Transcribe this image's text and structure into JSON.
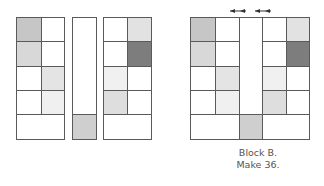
{
  "colors": {
    "white": "#ffffff",
    "gray_medium": "#c6c6c6",
    "gray_light": "#d8d8d8",
    "gray_lighter": "#e4e4e4",
    "gray_pale": "#f0f0f0",
    "gray_dark": "#7d7d7d",
    "gray_strip": "#cfcfcf",
    "line": "#5a5a5a"
  },
  "left_units": {
    "label": "Unpieced components",
    "four_patch_left": [
      "#c6c6c6",
      "#ffffff",
      "#d8d8d8",
      "#ffffff",
      "#ffffff",
      "#e4e4e4",
      "#ffffff",
      "#f0f0f0"
    ],
    "middle_strip": {
      "top": "#ffffff",
      "bottom": "#cfcfcf"
    },
    "four_patch_right": [
      "#ffffff",
      "#e2e2e2",
      "#ffffff",
      "#7d7d7d",
      "#f0f0f0",
      "#ffffff",
      "#dedede",
      "#ffffff"
    ]
  },
  "assembled_block": {
    "arrows": [
      "press-left-arrow",
      "press-right-arrow"
    ]
  },
  "caption": {
    "line1": "Block B.",
    "line2": "Make 36."
  }
}
